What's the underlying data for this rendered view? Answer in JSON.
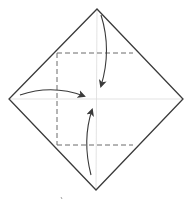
{
  "diagram": {
    "type": "origami-fold-diagram",
    "colors": {
      "outline": "#3a3a3a",
      "crease": "#d8d8d8",
      "dashed": "#6a6a6a",
      "arrow": "#3a3a3a",
      "background": "#ffffff"
    },
    "paper": {
      "top": [
        97,
        9
      ],
      "right": [
        183,
        99
      ],
      "bottom": [
        96,
        190
      ],
      "left": [
        9,
        99
      ]
    },
    "dashed_square": {
      "x1": 57,
      "y1": 53,
      "x2": 133,
      "y2": 145
    },
    "arrows": [
      {
        "name": "top-corner-to-center",
        "from": [
          101,
          15
        ],
        "to": [
          101,
          86
        ]
      },
      {
        "name": "left-corner-to-center",
        "from": [
          20,
          95
        ],
        "to": [
          84,
          96
        ]
      },
      {
        "name": "bottom-corner-to-center",
        "from": [
          91,
          175
        ],
        "to": [
          92,
          110
        ]
      }
    ]
  }
}
